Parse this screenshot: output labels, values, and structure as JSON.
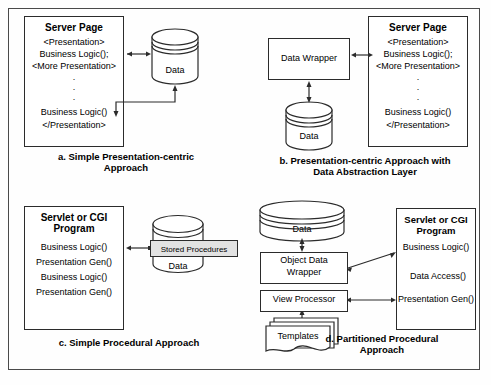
{
  "figure": {
    "panels": [
      {
        "id": "a",
        "caption": "a. Simple Presentation-centric\nApproach",
        "caption_line1": "a. Simple Presentation-centric",
        "caption_line2": "Approach",
        "server_page": {
          "title": "Server Page",
          "lines": [
            "<Presentation>",
            "Business Logic();",
            "<More Presentation>",
            ".",
            ".",
            ".",
            "Business Logic()",
            "</Presentation>"
          ]
        },
        "datastore": {
          "label": "Data"
        }
      },
      {
        "id": "b",
        "caption_line1": "b. Presentation-centric Approach with",
        "caption_line2": "Data Abstraction Layer",
        "wrapper": {
          "label": "Data Wrapper"
        },
        "datastore": {
          "label": "Data"
        },
        "server_page": {
          "title": "Server Page",
          "lines": [
            "<Presentation>",
            "Business Logic();",
            "<More Presentation>",
            ".",
            ".",
            ".",
            "Business Logic()",
            "</Presentation>"
          ]
        }
      },
      {
        "id": "c",
        "caption_line1": "c. Simple Procedural Approach",
        "caption_line2": "",
        "program": {
          "title_line1": "Servlet or CGI",
          "title_line2": "Program",
          "lines": [
            "Business Logic()",
            "Presentation Gen()",
            "Business Logic()",
            "Presentation Gen()"
          ]
        },
        "datastore": {
          "label": "Data"
        },
        "stored_procedures": {
          "label": "Stored Procedures"
        }
      },
      {
        "id": "d",
        "caption_line1": "d. Partitioned Procedural",
        "caption_line2": "Approach",
        "datastore": {
          "label": "Data"
        },
        "object_data_wrapper": {
          "line1": "Object Data",
          "line2": "Wrapper"
        },
        "view_processor": {
          "label": "View Processor"
        },
        "templates": {
          "label": "Templates"
        },
        "program": {
          "title_line1": "Servlet or CGI",
          "title_line2": "Program",
          "lines": [
            "Business Logic()",
            "Data Access()",
            "Presentation Gen()"
          ]
        }
      }
    ],
    "colors": {
      "frame": "#4a4a4a",
      "stroke": "#2b2b2b",
      "fill": "#ffffff",
      "stored_proc_fill": "#e2e2e2",
      "background": "#fefefe"
    }
  }
}
